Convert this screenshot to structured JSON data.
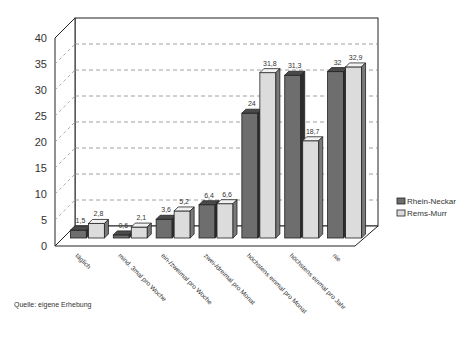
{
  "chart_data": {
    "type": "bar",
    "style": "3d-clustered",
    "title": "",
    "xlabel": "",
    "ylabel": "",
    "ylim": [
      0,
      40
    ],
    "yticks": [
      0,
      5,
      10,
      15,
      20,
      25,
      30,
      35,
      40
    ],
    "grid": true,
    "legend_position": "right",
    "categories": [
      "täglich",
      "mind. 3mal pro Woche",
      "ein-/zweimal pro Woche",
      "zwei-/dreimal pro Monat",
      "höchstens einmal pro Monat",
      "höchstens einmal pro Jahr",
      "nie"
    ],
    "series": [
      {
        "name": "Rhein-Neckar",
        "color": "#6e6e6e",
        "values": [
          1.5,
          0.6,
          3.6,
          6.4,
          24,
          31.3,
          32
        ],
        "labels": [
          "1,5",
          "0,6",
          "3,6",
          "6,4",
          "24",
          "31,3",
          "32"
        ]
      },
      {
        "name": "Rems-Murr",
        "color": "#dcdcdc",
        "values": [
          2.8,
          2.1,
          5.2,
          6.6,
          31.8,
          18.7,
          32.9
        ],
        "labels": [
          "2,8",
          "2,1",
          "5,2",
          "6,6",
          "31,8",
          "18,7",
          "32,9"
        ]
      }
    ]
  },
  "source": "Quelle: eigene Erhebung"
}
